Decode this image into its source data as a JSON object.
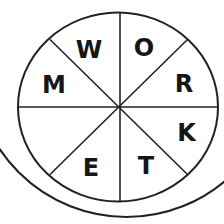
{
  "wheel": {
    "letters": {
      "top_left": "W",
      "top_right": "O",
      "right_upper": "R",
      "right_lower": "K",
      "bottom_right": "T",
      "bottom_left": "E",
      "left_upper": "M",
      "left_lower": ""
    },
    "stroke_color": "#222222",
    "letter_color": "#161616",
    "background_color": "#ffffff"
  }
}
